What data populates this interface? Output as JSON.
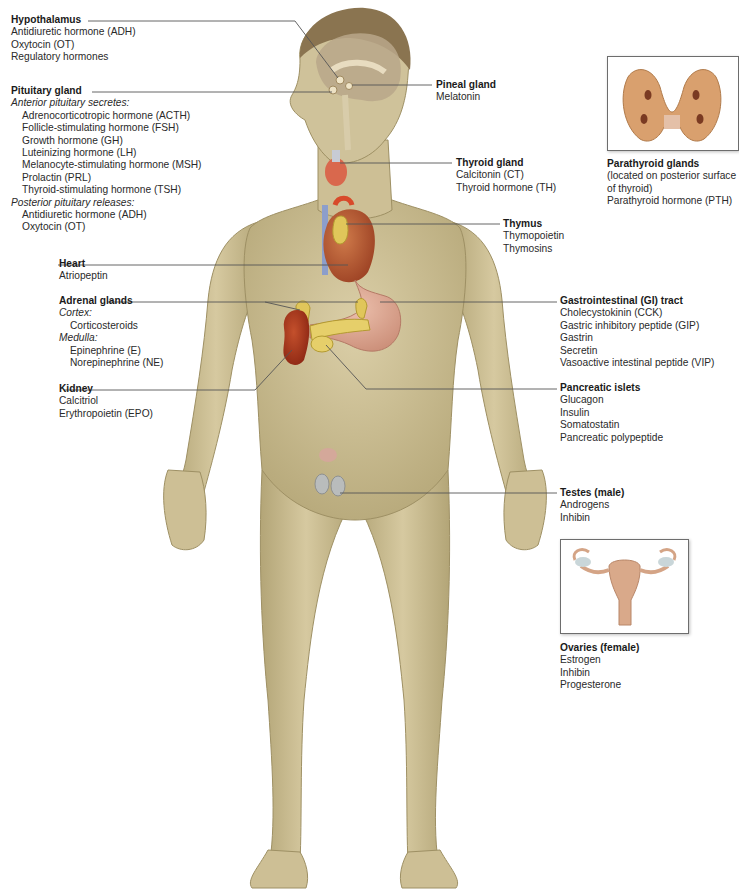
{
  "diagram": {
    "colors": {
      "skin": "#cdbf95",
      "skin_shadow": "#a89a6c",
      "hair": "#8a7450",
      "brain": "#b8a78a",
      "thyroid": "#d9684d",
      "heart": "#b8552f",
      "thymus_adrenal_pancreas": "#e0c65a",
      "kidney": "#a8321c",
      "stomach": "#d9a08c",
      "vessel_blue": "#8c9ecb",
      "testes": "#b9bcbc",
      "leader_line": "#555555"
    }
  },
  "labels": {
    "hypothalamus": {
      "title": "Hypothalamus",
      "items": [
        "Antidiuretic hormone (ADH)",
        "Oxytocin (OT)",
        "Regulatory hormones"
      ]
    },
    "pituitary": {
      "title": "Pituitary gland",
      "anterior_heading": "Anterior pituitary secretes:",
      "anterior_items": [
        "Adrenocorticotropic hormone (ACTH)",
        "Follicle-stimulating hormone (FSH)",
        "Growth hormone (GH)",
        "Luteinizing hormone (LH)",
        "Melanocyte-stimulating hormone (MSH)",
        "Prolactin (PRL)",
        "Thyroid-stimulating hormone (TSH)"
      ],
      "posterior_heading": "Posterior pituitary releases:",
      "posterior_items": [
        "Antidiuretic hormone (ADH)",
        "Oxytocin (OT)"
      ]
    },
    "heart": {
      "title": "Heart",
      "items": [
        "Atriopeptin"
      ]
    },
    "adrenal": {
      "title": "Adrenal glands",
      "cortex_heading": "Cortex:",
      "cortex_items": [
        "Corticosteroids"
      ],
      "medulla_heading": "Medulla:",
      "medulla_items": [
        "Epinephrine (E)",
        "Norepinephrine (NE)"
      ]
    },
    "kidney": {
      "title": "Kidney",
      "items": [
        "Calcitriol",
        "Erythropoietin (EPO)"
      ]
    },
    "pineal": {
      "title": "Pineal gland",
      "items": [
        "Melatonin"
      ]
    },
    "thyroid": {
      "title": "Thyroid gland",
      "items": [
        "Calcitonin (CT)",
        "Thyroid hormone (TH)"
      ]
    },
    "thymus": {
      "title": "Thymus",
      "items": [
        "Thymopoietin",
        "Thymosins"
      ]
    },
    "parathyroid": {
      "title": "Parathyroid glands",
      "items": [
        "(located on posterior surface",
        "of thyroid)",
        "Parathyroid hormone (PTH)"
      ]
    },
    "gi_tract": {
      "title": "Gastrointestinal (GI) tract",
      "items": [
        "Cholecystokinin (CCK)",
        "Gastric inhibitory peptide (GIP)",
        "Gastrin",
        "Secretin",
        "Vasoactive intestinal peptide (VIP)"
      ]
    },
    "pancreatic": {
      "title": "Pancreatic islets",
      "items": [
        "Glucagon",
        "Insulin",
        "Somatostatin",
        "Pancreatic polypeptide"
      ]
    },
    "testes": {
      "title": "Testes (male)",
      "items": [
        "Androgens",
        "Inhibin"
      ]
    },
    "ovaries": {
      "title": "Ovaries (female)",
      "items": [
        "Estrogen",
        "Inhibin",
        "Progesterone"
      ]
    }
  }
}
